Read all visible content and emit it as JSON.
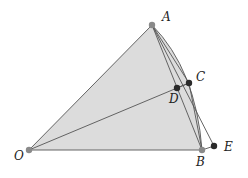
{
  "diagram": {
    "title": "",
    "points": {
      "O": {
        "label": "O",
        "x": 29,
        "y": 150,
        "style": "gray"
      },
      "A": {
        "label": "A",
        "x": 152,
        "y": 25,
        "style": "gray"
      },
      "B": {
        "label": "B",
        "x": 202,
        "y": 150,
        "style": "gray"
      },
      "C": {
        "label": "C",
        "x": 189,
        "y": 83,
        "style": "dark"
      },
      "D": {
        "label": "D",
        "x": 177,
        "y": 88,
        "style": "dark"
      },
      "E": {
        "label": "E",
        "x": 214,
        "y": 146,
        "style": "dark"
      }
    },
    "colors": {
      "fill": "#dcdcdc",
      "stroke": "#555555",
      "gray_point": "#8a8a8a",
      "dark_point": "#2a2a2a"
    }
  }
}
